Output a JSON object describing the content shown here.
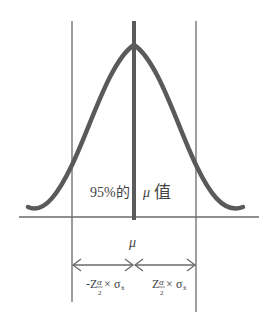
{
  "diagram": {
    "title": "",
    "center_label": "μ",
    "region_label_prefix": "95%的",
    "region_label_mu": "μ",
    "region_label_suffix": "值",
    "left_interval": {
      "sign": "-",
      "z": "Z",
      "alpha": "α",
      "denom": "2",
      "times": "×",
      "sigma": "σ",
      "sub": "x̄"
    },
    "right_interval": {
      "sign": "",
      "z": "Z",
      "alpha": "α",
      "denom": "2",
      "times": "×",
      "sigma": "σ",
      "sub": "x̄"
    },
    "colors": {
      "curve": "#5a5a5a",
      "lines": "#6a6a6a",
      "text": "#444444"
    }
  }
}
